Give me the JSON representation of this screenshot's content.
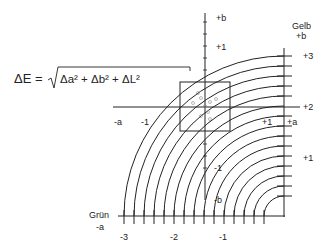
{
  "formula": {
    "lhs": "ΔE =",
    "radicand": "Δa² + Δb² + ΔL²"
  },
  "axis_labels": {
    "plus_b_top": "+b",
    "plus_1_top": "+1",
    "gelb": "Gelb",
    "gelb_plus_b": "+b",
    "plus_3_right": "+3",
    "plus_2_right": "+2",
    "plus_1_right": "+1",
    "minus_a_left": "-a",
    "minus_1_left": "-1",
    "plus_1_mid": "+1",
    "plus_a_mid": "+a",
    "minus_1_lower": "-1",
    "minus_b_lower": "-b",
    "gruen": "Grün",
    "gruen_minus_a": "-a",
    "minus_3_bottom": "-3",
    "minus_2_bottom": "-2",
    "minus_1_bottom": "-1"
  },
  "colors": {
    "line": "#222222",
    "background": "#ffffff"
  },
  "arcs": {
    "count": 15,
    "center": [
      284,
      216
    ],
    "max_radius": 160,
    "spacing": 10
  }
}
